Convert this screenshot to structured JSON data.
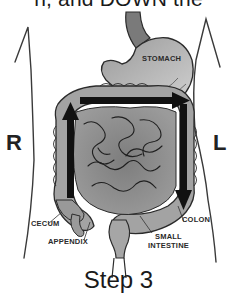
{
  "caption": {
    "top_partial": "n, and DOWN the",
    "bottom_partial": "Step 3"
  },
  "sides": {
    "right": "R",
    "left": "L"
  },
  "labels": {
    "stomach": "STOMACH",
    "cecum": "CECUM",
    "appendix": "APPENDIX",
    "colon": "COLON",
    "small_intestine_line1": "SMALL",
    "small_intestine_line2": "INTESTINE"
  },
  "arrows": [
    {
      "name": "ascending",
      "direction": "up",
      "side": "right"
    },
    {
      "name": "transverse",
      "direction": "right-to-left-of-body",
      "side": "top"
    },
    {
      "name": "descending",
      "direction": "down",
      "side": "left"
    }
  ],
  "colors": {
    "organ_fill": "#8c8c8c",
    "organ_light": "#b5b5b5",
    "outline": "#2b2b2b",
    "arrow": "#111111",
    "background": "#ffffff"
  }
}
